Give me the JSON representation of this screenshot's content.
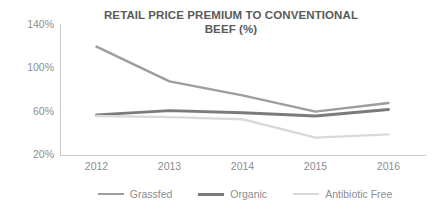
{
  "chart_data": {
    "type": "line",
    "title": "RETAIL PRICE PREMIUM TO CONVENTIONAL BEEF (%)",
    "title_lines": [
      "RETAIL PRICE PREMIUM TO CONVENTIONAL",
      "BEEF (%)"
    ],
    "xlabel": "",
    "ylabel": "",
    "categories": [
      "2012",
      "2013",
      "2014",
      "2015",
      "2016"
    ],
    "x": [
      2012,
      2013,
      2014,
      2015,
      2016
    ],
    "ylim": [
      20,
      140
    ],
    "yticks": [
      20,
      60,
      100,
      140
    ],
    "ytick_labels": [
      "20%",
      "60%",
      "100%",
      "140%"
    ],
    "grid": false,
    "legend_position": "bottom",
    "series": [
      {
        "name": "Grassfed",
        "color": "#9d9d9d",
        "width": 2.4,
        "values": [
          120,
          88,
          75,
          60,
          68
        ]
      },
      {
        "name": "Organic",
        "color": "#7b7b7b",
        "width": 2.8,
        "values": [
          57,
          61,
          59,
          56,
          62
        ]
      },
      {
        "name": "Antibiotic Free",
        "color": "#d9d9d9",
        "width": 2.4,
        "values": [
          56,
          55,
          53,
          36,
          39
        ]
      }
    ]
  },
  "style": {
    "axis_color": "#c9c9c9",
    "tick_text_color": "#8d8d8d",
    "title_color": "#5a5a5a",
    "background": "#ffffff"
  }
}
